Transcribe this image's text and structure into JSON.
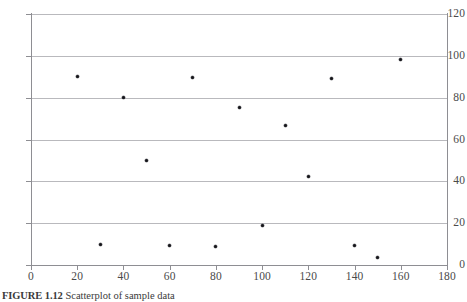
{
  "figure": {
    "caption_label": "FIGURE 1.12",
    "caption_text": "Scatterplot of sample data"
  },
  "chart_data": {
    "type": "scatter",
    "title": "",
    "xlabel": "",
    "ylabel": "",
    "xlim": [
      0,
      180
    ],
    "ylim": [
      0,
      120
    ],
    "xticks": [
      0,
      20,
      40,
      60,
      80,
      100,
      120,
      140,
      160,
      180
    ],
    "yticks": [
      0,
      20,
      40,
      60,
      80,
      100,
      120
    ],
    "xtick_labels": [
      "0",
      "20",
      "40",
      "60",
      "80",
      "100",
      "120",
      "140",
      "160",
      "180"
    ],
    "ytick_labels": [
      "0",
      "20",
      "40",
      "60",
      "80",
      "100",
      "120"
    ],
    "grid": "horizontal",
    "legend": "none",
    "marker_color": "#15151a",
    "gridline_color": "#b9b9bd",
    "axis_color": "#8e8e93",
    "points": [
      {
        "x": 20,
        "y": 90.0
      },
      {
        "x": 30,
        "y": 10.0
      },
      {
        "x": 40,
        "y": 80.0
      },
      {
        "x": 50,
        "y": 50.0
      },
      {
        "x": 60,
        "y": 9.5
      },
      {
        "x": 70,
        "y": 89.5
      },
      {
        "x": 80,
        "y": 9.0
      },
      {
        "x": 90,
        "y": 75.5
      },
      {
        "x": 100,
        "y": 19.0
      },
      {
        "x": 110,
        "y": 66.5
      },
      {
        "x": 120,
        "y": 42.5
      },
      {
        "x": 130,
        "y": 89.0
      },
      {
        "x": 140,
        "y": 9.5
      },
      {
        "x": 150,
        "y": 3.5
      },
      {
        "x": 160,
        "y": 98.5
      }
    ]
  }
}
